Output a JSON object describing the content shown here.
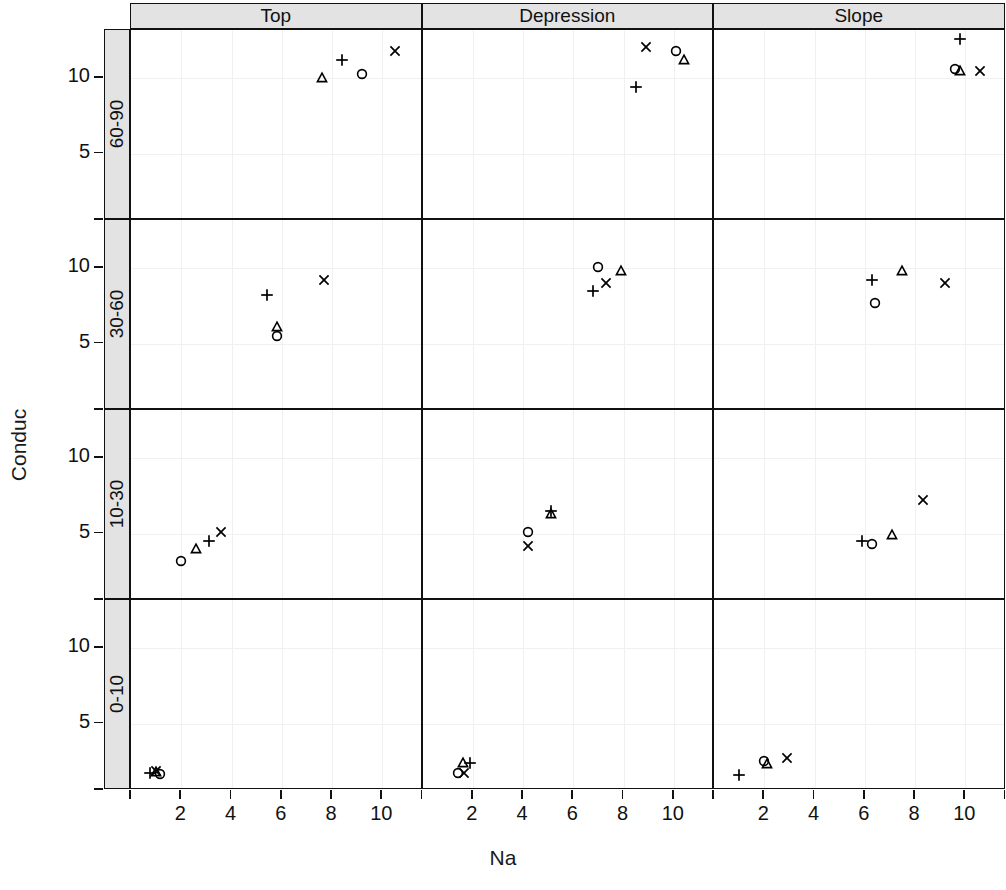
{
  "chart_data": {
    "type": "scatter",
    "title": "",
    "xlabel": "Na",
    "ylabel": "Conduc",
    "layout": "trellis 3 columns x 4 rows, conditioned on Position (columns) and Depth (rows)",
    "legend_position": "none",
    "grid": true,
    "xlim": [
      0,
      11.6
    ],
    "ylim": [
      0.6,
      13.2
    ],
    "xticks": [
      2,
      4,
      6,
      8,
      10
    ],
    "yticks": [
      5,
      10
    ],
    "column_groups": [
      "Top",
      "Depression",
      "Slope"
    ],
    "row_groups": [
      "60-90",
      "30-60",
      "10-30",
      "0-10"
    ],
    "row_order_top_to_bottom": [
      "60-90",
      "30-60",
      "10-30",
      "0-10"
    ],
    "symbols": [
      "circle",
      "triangle",
      "plus",
      "cross"
    ],
    "panels": [
      {
        "column": "Top",
        "row": "60-90",
        "points": [
          {
            "symbol": "triangle",
            "x": 7.6,
            "y": 10.0
          },
          {
            "symbol": "plus",
            "x": 8.4,
            "y": 11.2
          },
          {
            "symbol": "circle",
            "x": 9.2,
            "y": 10.3
          },
          {
            "symbol": "cross",
            "x": 10.5,
            "y": 11.8
          }
        ]
      },
      {
        "column": "Depression",
        "row": "60-90",
        "points": [
          {
            "symbol": "plus",
            "x": 8.5,
            "y": 9.4
          },
          {
            "symbol": "cross",
            "x": 8.9,
            "y": 12.1
          },
          {
            "symbol": "circle",
            "x": 10.1,
            "y": 11.8
          },
          {
            "symbol": "triangle",
            "x": 10.4,
            "y": 11.2
          }
        ]
      },
      {
        "column": "Slope",
        "row": "60-90",
        "points": [
          {
            "symbol": "plus",
            "x": 9.8,
            "y": 12.6
          },
          {
            "symbol": "circle",
            "x": 9.6,
            "y": 10.6
          },
          {
            "symbol": "triangle",
            "x": 9.8,
            "y": 10.5
          },
          {
            "symbol": "cross",
            "x": 10.6,
            "y": 10.5
          }
        ]
      },
      {
        "column": "Top",
        "row": "30-60",
        "points": [
          {
            "symbol": "plus",
            "x": 5.4,
            "y": 8.2
          },
          {
            "symbol": "triangle",
            "x": 5.8,
            "y": 6.1
          },
          {
            "symbol": "circle",
            "x": 5.8,
            "y": 5.5
          },
          {
            "symbol": "cross",
            "x": 7.7,
            "y": 9.2
          }
        ]
      },
      {
        "column": "Depression",
        "row": "30-60",
        "points": [
          {
            "symbol": "circle",
            "x": 7.0,
            "y": 10.1
          },
          {
            "symbol": "plus",
            "x": 6.8,
            "y": 8.5
          },
          {
            "symbol": "cross",
            "x": 7.3,
            "y": 9.0
          },
          {
            "symbol": "triangle",
            "x": 7.9,
            "y": 9.8
          }
        ]
      },
      {
        "column": "Slope",
        "row": "30-60",
        "points": [
          {
            "symbol": "plus",
            "x": 6.3,
            "y": 9.2
          },
          {
            "symbol": "circle",
            "x": 6.4,
            "y": 7.7
          },
          {
            "symbol": "triangle",
            "x": 7.5,
            "y": 9.8
          },
          {
            "symbol": "cross",
            "x": 9.2,
            "y": 9.0
          }
        ]
      },
      {
        "column": "Top",
        "row": "10-30",
        "points": [
          {
            "symbol": "circle",
            "x": 2.0,
            "y": 3.2
          },
          {
            "symbol": "triangle",
            "x": 2.6,
            "y": 4.0
          },
          {
            "symbol": "plus",
            "x": 3.1,
            "y": 4.5
          },
          {
            "symbol": "cross",
            "x": 3.6,
            "y": 5.1
          }
        ]
      },
      {
        "column": "Depression",
        "row": "10-30",
        "points": [
          {
            "symbol": "cross",
            "x": 4.2,
            "y": 4.2
          },
          {
            "symbol": "circle",
            "x": 4.2,
            "y": 5.1
          },
          {
            "symbol": "triangle",
            "x": 5.1,
            "y": 6.3
          },
          {
            "symbol": "plus",
            "x": 5.1,
            "y": 6.5
          }
        ]
      },
      {
        "column": "Slope",
        "row": "10-30",
        "points": [
          {
            "symbol": "plus",
            "x": 5.9,
            "y": 4.5
          },
          {
            "symbol": "circle",
            "x": 6.3,
            "y": 4.3
          },
          {
            "symbol": "triangle",
            "x": 7.1,
            "y": 4.9
          },
          {
            "symbol": "cross",
            "x": 8.3,
            "y": 7.2
          }
        ]
      },
      {
        "column": "Top",
        "row": "0-10",
        "points": [
          {
            "symbol": "plus",
            "x": 0.75,
            "y": 1.75
          },
          {
            "symbol": "cross",
            "x": 1.0,
            "y": 1.85
          },
          {
            "symbol": "triangle",
            "x": 1.0,
            "y": 1.8
          },
          {
            "symbol": "circle",
            "x": 1.15,
            "y": 1.65
          }
        ]
      },
      {
        "column": "Depression",
        "row": "0-10",
        "points": [
          {
            "symbol": "triangle",
            "x": 1.6,
            "y": 2.4
          },
          {
            "symbol": "plus",
            "x": 1.9,
            "y": 2.4
          },
          {
            "symbol": "circle",
            "x": 1.4,
            "y": 1.7
          },
          {
            "symbol": "cross",
            "x": 1.65,
            "y": 1.7
          }
        ]
      },
      {
        "column": "Slope",
        "row": "0-10",
        "points": [
          {
            "symbol": "plus",
            "x": 1.0,
            "y": 1.6
          },
          {
            "symbol": "circle",
            "x": 2.0,
            "y": 2.5
          },
          {
            "symbol": "triangle",
            "x": 2.1,
            "y": 2.3
          },
          {
            "symbol": "cross",
            "x": 2.9,
            "y": 2.75
          }
        ]
      }
    ]
  },
  "axes": {
    "x_title": "Na",
    "y_title": "Conduc",
    "x_tick_labels": [
      "2",
      "4",
      "6",
      "8",
      "10"
    ],
    "y_tick_labels": [
      "5",
      "10"
    ]
  },
  "strips": {
    "columns": [
      "Top",
      "Depression",
      "Slope"
    ],
    "rows": [
      "60-90",
      "30-60",
      "10-30",
      "0-10"
    ]
  },
  "colors": {
    "strip_background": "#e3e3e3",
    "panel_background": "#ffffff",
    "border": "#111111",
    "gridline": "#f0f0f0",
    "symbol": "#000000"
  }
}
